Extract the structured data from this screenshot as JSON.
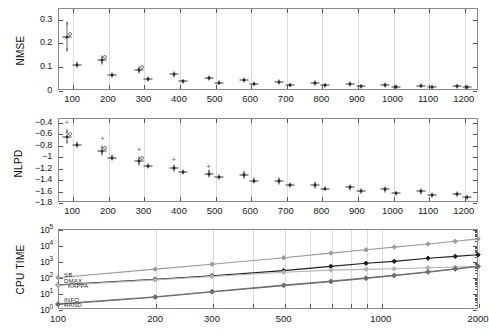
{
  "figure": {
    "background": "#ffffff",
    "width": 488,
    "height": 335
  },
  "panels": {
    "nmse": {
      "ylabel": "NMSE",
      "yticks": [
        "0",
        "0.1",
        "0.2",
        "0.3"
      ],
      "xticks": [
        "100",
        "200",
        "300",
        "400",
        "500",
        "600",
        "700",
        "800",
        "900",
        "1000",
        "1100",
        "1200"
      ]
    },
    "nlpd": {
      "ylabel": "NLPD",
      "yticks": [
        "-1.8",
        "-1.6",
        "-1.4",
        "-1.2",
        "-1",
        "-0.8",
        "-0.6",
        "-0.4"
      ],
      "xticks": [
        "100",
        "200",
        "300",
        "400",
        "500",
        "600",
        "700",
        "800",
        "900",
        "1000",
        "1100",
        "1200"
      ]
    },
    "cputime": {
      "ylabel": "CPU TIME",
      "yticks": [
        "10",
        "10",
        "10",
        "10",
        "10",
        "10"
      ],
      "yexp": [
        "0",
        "1",
        "2",
        "3",
        "4",
        "5"
      ],
      "xticks": [
        "100",
        "200",
        "300",
        "500",
        "1000",
        "2000"
      ]
    }
  },
  "chart_data": [
    {
      "type": "scatter",
      "title": "",
      "xlabel": "",
      "ylabel": "NMSE",
      "xlim": [
        60,
        1240
      ],
      "ylim": [
        0,
        0.345
      ],
      "grid": true,
      "legend": "none",
      "series": [
        {
          "name": "group-A",
          "marker": "dot-with-errorbar",
          "x": [
            85,
            185,
            288,
            385,
            483,
            583,
            682,
            781,
            881,
            980,
            1080,
            1180
          ],
          "y": [
            0.225,
            0.125,
            0.083,
            0.066,
            0.05,
            0.043,
            0.035,
            0.03,
            0.025,
            0.021,
            0.017,
            0.015
          ],
          "yerr": [
            0.055,
            0.012,
            0.008,
            0.006,
            0.005,
            0.004,
            0.004,
            0.003,
            0.003,
            0.003,
            0.002,
            0.002
          ]
        },
        {
          "name": "group-B",
          "marker": "dot-with-errorbar",
          "x": [
            113,
            213,
            312,
            411,
            511,
            611,
            711,
            811,
            910,
            1010,
            1110,
            1210
          ],
          "y": [
            0.106,
            0.063,
            0.046,
            0.036,
            0.03,
            0.026,
            0.021,
            0.019,
            0.016,
            0.014,
            0.012,
            0.011
          ],
          "yerr": [
            0.006,
            0.004,
            0.003,
            0.003,
            0.002,
            0.002,
            0.002,
            0.002,
            0.002,
            0.002,
            0.001,
            0.001
          ]
        }
      ]
    },
    {
      "type": "scatter",
      "title": "",
      "xlabel": "",
      "ylabel": "NLPD",
      "xlim": [
        60,
        1240
      ],
      "ylim": [
        -1.8,
        -0.33
      ],
      "grid": true,
      "legend": "none",
      "series": [
        {
          "name": "group-A",
          "marker": "dot-with-errorbar",
          "x": [
            85,
            185,
            288,
            385,
            483,
            583,
            682,
            781,
            881,
            980,
            1080,
            1180
          ],
          "y": [
            -0.655,
            -0.905,
            -1.085,
            -1.205,
            -1.305,
            -1.33,
            -1.43,
            -1.5,
            -1.545,
            -1.58,
            -1.615,
            -1.66
          ],
          "yerr": [
            0.1,
            0.06,
            0.05,
            0.04,
            0.04,
            0.035,
            0.03,
            0.03,
            0.025,
            0.025,
            0.02,
            0.02
          ]
        },
        {
          "name": "group-B",
          "marker": "dot-with-errorbar",
          "x": [
            113,
            213,
            312,
            411,
            511,
            611,
            711,
            811,
            910,
            1010,
            1110,
            1210
          ],
          "y": [
            -0.795,
            -1.025,
            -1.165,
            -1.275,
            -1.36,
            -1.425,
            -1.5,
            -1.565,
            -1.61,
            -1.65,
            -1.675,
            -1.72
          ],
          "yerr": [
            0.03,
            0.025,
            0.02,
            0.02,
            0.02,
            0.02,
            0.015,
            0.015,
            0.015,
            0.015,
            0.012,
            0.012
          ]
        },
        {
          "name": "outlier-upper",
          "marker": "plus",
          "x": [
            85,
            185,
            288,
            385,
            483,
            583
          ],
          "y": [
            -0.4,
            -0.675,
            -0.875,
            -1.045,
            -1.175,
            -1.285
          ]
        }
      ]
    },
    {
      "type": "line",
      "title": "",
      "xlabel": "",
      "ylabel": "CPU TIME",
      "xscale": "log",
      "yscale": "log",
      "xlim": [
        100,
        2000
      ],
      "ylim": [
        1,
        100000
      ],
      "grid": true,
      "legend": "inline-left",
      "series": [
        {
          "name": "SB",
          "color": "#9a9a9a",
          "marker": "diamond",
          "x": [
            100,
            200,
            300,
            500,
            700,
            900,
            1100,
            1400,
            1700,
            2000
          ],
          "y": [
            90,
            310,
            620,
            1600,
            3100,
            5000,
            7400,
            11500,
            17000,
            24000
          ]
        },
        {
          "name": "DMAX",
          "color": "#1e1e1e",
          "marker": "diamond",
          "x": [
            100,
            200,
            300,
            500,
            700,
            900,
            1100,
            1400,
            1700,
            2000
          ],
          "y": [
            32,
            72,
            120,
            250,
            460,
            720,
            950,
            1500,
            1950,
            2450
          ]
        },
        {
          "name": "KAPPA",
          "color": "#b4b4b4",
          "marker": "diamond",
          "x": [
            100,
            200,
            300,
            500,
            700,
            900,
            1100,
            1400,
            1700,
            2000
          ],
          "y": [
            30,
            66,
            108,
            200,
            270,
            300,
            330,
            380,
            420,
            470
          ]
        },
        {
          "name": "INFO",
          "color": "#777777",
          "marker": "diamond",
          "x": [
            100,
            200,
            300,
            500,
            700,
            900,
            1100,
            1400,
            1700,
            2000
          ],
          "y": [
            2.1,
            5.8,
            12.5,
            31,
            55,
            88,
            130,
            215,
            330,
            470
          ]
        },
        {
          "name": "RAND",
          "color": "#6e6e6e",
          "marker": "diamond",
          "x": [
            100,
            200,
            300,
            500,
            700,
            900,
            1100,
            1400,
            1700,
            2000
          ],
          "y": [
            1.9,
            5.4,
            11.5,
            29,
            51,
            82,
            122,
            200,
            310,
            450
          ]
        }
      ],
      "inline_labels": [
        "SB",
        "DMAX",
        "KAPPA",
        "INFO",
        "RAND"
      ]
    }
  ]
}
